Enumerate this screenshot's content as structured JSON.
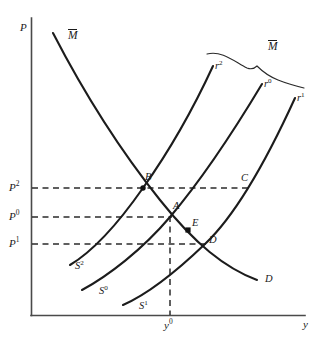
{
  "figure": {
    "type": "economics-diagram",
    "background_color": "#ffffff",
    "line_color": "#1c1c1c",
    "axis_color": "#4a4a4a"
  },
  "axes": {
    "y_axis_label": "P",
    "x_axis_label": "y",
    "origin_px": [
      31,
      315
    ],
    "y_axis_top_px": 18,
    "x_axis_right_px": 305
  },
  "price_levels": [
    {
      "id": "p2",
      "base": "P",
      "exp": "2",
      "y_px": 188
    },
    {
      "id": "p0",
      "base": "P",
      "exp": "0",
      "y_px": 217
    },
    {
      "id": "p1",
      "base": "P",
      "exp": "1",
      "y_px": 244
    }
  ],
  "output_levels": [
    {
      "id": "y0",
      "base": "y",
      "exp": "0",
      "x_px": 170
    }
  ],
  "supply_curves": [
    {
      "id": "s2",
      "base": "S",
      "exp": "2",
      "label_x": 75,
      "label_y": 266
    },
    {
      "id": "s0",
      "base": "S",
      "exp": "0",
      "label_x": 99,
      "label_y": 291
    },
    {
      "id": "s1",
      "base": "S",
      "exp": "1",
      "label_x": 139,
      "label_y": 306
    }
  ],
  "rate_curves": [
    {
      "id": "r2",
      "base": "r",
      "exp": "2",
      "label_x": 215,
      "label_y": 66
    },
    {
      "id": "r0",
      "base": "r",
      "exp": "0",
      "label_x": 264,
      "label_y": 84
    },
    {
      "id": "r1",
      "base": "r",
      "exp": "1",
      "label_x": 297,
      "label_y": 98
    }
  ],
  "demand_curve": {
    "id": "demand",
    "start_label": "M",
    "start_label_overbar": true,
    "start_label_x": 68,
    "start_label_y": 36,
    "end_label": "D",
    "end_label_x": 265,
    "end_label_y": 279
  },
  "money_brace": {
    "label": "M",
    "overbar": true,
    "label_x": 268,
    "label_y": 47
  },
  "points": [
    {
      "id": "A",
      "label": "A",
      "x": 170,
      "y": 217,
      "label_x": 173,
      "label_y": 206,
      "marker": "none"
    },
    {
      "id": "B",
      "label": "B",
      "x": 143,
      "y": 188,
      "label_x": 145,
      "label_y": 176,
      "marker": "dot"
    },
    {
      "id": "C",
      "label": "C",
      "x": 245,
      "y": 188,
      "label_x": 241,
      "label_y": 177,
      "marker": "none"
    },
    {
      "id": "D",
      "label": "D",
      "x": 205,
      "y": 244,
      "label_x": 209,
      "label_y": 239,
      "marker": "none"
    },
    {
      "id": "E",
      "label": "E",
      "x": 188,
      "y": 230,
      "label_x": 192,
      "label_y": 222,
      "marker": "square"
    }
  ],
  "dashed_guides": [
    {
      "id": "p2-guide",
      "from": [
        31,
        188
      ],
      "to": [
        250,
        188
      ],
      "orientation": "horizontal"
    },
    {
      "id": "p0-guide",
      "from": [
        31,
        217
      ],
      "to": [
        172,
        217
      ],
      "orientation": "horizontal"
    },
    {
      "id": "p1-guide",
      "from": [
        31,
        244
      ],
      "to": [
        207,
        244
      ],
      "orientation": "horizontal"
    },
    {
      "id": "y0-guide",
      "from": [
        170,
        217
      ],
      "to": [
        170,
        315
      ],
      "orientation": "vertical"
    }
  ]
}
